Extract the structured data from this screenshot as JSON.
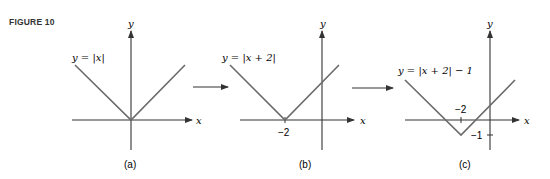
{
  "figure": {
    "label": "FIGURE 10",
    "panels": [
      {
        "id": "a",
        "caption": "(a)",
        "equation": "y = |x|",
        "x_axis_label": "x",
        "y_axis_label": "y",
        "vertex": [
          0,
          0
        ],
        "tick_labels": []
      },
      {
        "id": "b",
        "caption": "(b)",
        "equation": "y = |x + 2|",
        "x_axis_label": "x",
        "y_axis_label": "y",
        "vertex": [
          -2,
          0
        ],
        "tick_labels": [
          "−2"
        ]
      },
      {
        "id": "c",
        "caption": "(c)",
        "equation": "y = |x + 2| − 1",
        "x_axis_label": "x",
        "y_axis_label": "y",
        "vertex": [
          -2,
          -1
        ],
        "tick_labels": [
          "−2",
          "−1"
        ]
      }
    ],
    "arrows": [
      "a-to-b",
      "b-to-c"
    ]
  },
  "colors": {
    "graph_line": "#6b6b6b",
    "axis": "#333333",
    "text": "#222222"
  }
}
